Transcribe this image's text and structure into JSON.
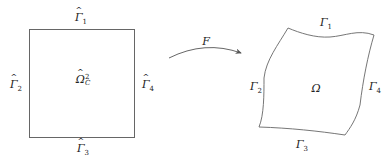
{
  "reference_domain": {
    "name": "Ω̂_C^2",
    "symbol": "Ω",
    "subscript": "C",
    "superscript": "2",
    "edges": [
      {
        "id": "top",
        "symbol": "Γ",
        "index": "1"
      },
      {
        "id": "left",
        "symbol": "Γ",
        "index": "2"
      },
      {
        "id": "bottom",
        "symbol": "Γ",
        "index": "3"
      },
      {
        "id": "right",
        "symbol": "Γ",
        "index": "4"
      }
    ]
  },
  "mapping": {
    "label": "F"
  },
  "physical_domain": {
    "symbol": "Ω",
    "edges": [
      {
        "id": "top",
        "symbol": "Γ",
        "index": "1"
      },
      {
        "id": "left",
        "symbol": "Γ",
        "index": "2"
      },
      {
        "id": "bottom",
        "symbol": "Γ",
        "index": "3"
      },
      {
        "id": "right",
        "symbol": "Γ",
        "index": "4"
      }
    ]
  },
  "colors": {
    "stroke": "#555555",
    "text": "#222222"
  }
}
